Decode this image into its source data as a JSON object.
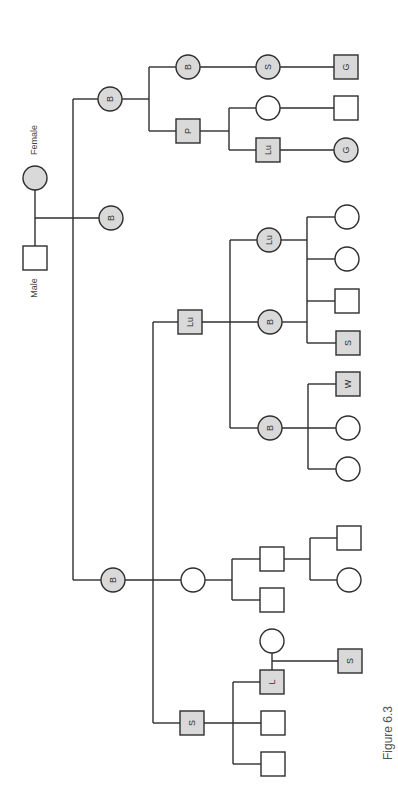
{
  "figure": {
    "caption": "Figure 6.3",
    "orientation": "rotated 90 degrees counter-clockwise",
    "colors": {
      "affected_fill": "#d9d9d9",
      "unaffected_fill": "#ffffff",
      "stroke": "#2e2e2e"
    }
  },
  "legend": {
    "female_label": "Female",
    "male_label": "Male"
  },
  "nodes": [
    {
      "id": "founder-female",
      "shape": "circle",
      "filled": true,
      "label": "",
      "x": 35,
      "y": 178
    },
    {
      "id": "founder-male",
      "shape": "square",
      "filled": false,
      "label": "",
      "x": 35,
      "y": 258
    },
    {
      "id": "g1-b-top",
      "shape": "circle",
      "filled": true,
      "label": "B",
      "x": 110,
      "y": 99
    },
    {
      "id": "g1-b-mid",
      "shape": "circle",
      "filled": true,
      "label": "B",
      "x": 111,
      "y": 218
    },
    {
      "id": "g1-b-low",
      "shape": "circle",
      "filled": true,
      "label": "B",
      "x": 113,
      "y": 580
    },
    {
      "id": "g2-b",
      "shape": "circle",
      "filled": true,
      "label": "B",
      "x": 188,
      "y": 67
    },
    {
      "id": "g2-p",
      "shape": "square",
      "filled": true,
      "label": "P",
      "x": 188,
      "y": 131
    },
    {
      "id": "g2-lu",
      "shape": "square",
      "filled": true,
      "label": "Lu",
      "x": 190,
      "y": 322
    },
    {
      "id": "g2-spouse-circle",
      "shape": "circle",
      "filled": false,
      "label": "",
      "x": 193,
      "y": 580
    },
    {
      "id": "g2-s",
      "shape": "square",
      "filled": true,
      "label": "S",
      "x": 192,
      "y": 723
    },
    {
      "id": "g3-s-circle",
      "shape": "circle",
      "filled": true,
      "label": "S",
      "x": 268,
      "y": 67
    },
    {
      "id": "g3-p-child-circle",
      "shape": "circle",
      "filled": false,
      "label": "",
      "x": 268,
      "y": 108
    },
    {
      "id": "g3-p-child-lu",
      "shape": "square",
      "filled": true,
      "label": "Lu",
      "x": 268,
      "y": 150
    },
    {
      "id": "g3-lu-circle",
      "shape": "circle",
      "filled": true,
      "label": "Lu",
      "x": 269,
      "y": 240
    },
    {
      "id": "g3-b-circle-a",
      "shape": "circle",
      "filled": true,
      "label": "B",
      "x": 270,
      "y": 322
    },
    {
      "id": "g3-b-circle-b",
      "shape": "circle",
      "filled": true,
      "label": "B",
      "x": 270,
      "y": 428
    },
    {
      "id": "g3-sq-a",
      "shape": "square",
      "filled": false,
      "label": "",
      "x": 272,
      "y": 559
    },
    {
      "id": "g3-sq-b",
      "shape": "square",
      "filled": false,
      "label": "",
      "x": 272,
      "y": 600
    },
    {
      "id": "g3-spouse-circle",
      "shape": "circle",
      "filled": false,
      "label": "",
      "x": 272,
      "y": 641
    },
    {
      "id": "g3-l",
      "shape": "square",
      "filled": true,
      "label": "L",
      "x": 272,
      "y": 682
    },
    {
      "id": "g3-sq-c",
      "shape": "square",
      "filled": false,
      "label": "",
      "x": 273,
      "y": 723
    },
    {
      "id": "g3-sq-d",
      "shape": "square",
      "filled": false,
      "label": "",
      "x": 273,
      "y": 764
    },
    {
      "id": "g4-g-square",
      "shape": "square",
      "filled": true,
      "label": "G",
      "x": 346,
      "y": 67
    },
    {
      "id": "g4-square",
      "shape": "square",
      "filled": false,
      "label": "",
      "x": 346,
      "y": 108
    },
    {
      "id": "g4-g-circle",
      "shape": "circle",
      "filled": true,
      "label": "G",
      "x": 346,
      "y": 150
    },
    {
      "id": "g4-circle-a",
      "shape": "circle",
      "filled": false,
      "label": "",
      "x": 347,
      "y": 217
    },
    {
      "id": "g4-circle-b",
      "shape": "circle",
      "filled": false,
      "label": "",
      "x": 347,
      "y": 259
    },
    {
      "id": "g4-square-c",
      "shape": "square",
      "filled": false,
      "label": "",
      "x": 347,
      "y": 301
    },
    {
      "id": "g4-s-square",
      "shape": "square",
      "filled": true,
      "label": "S",
      "x": 348,
      "y": 343
    },
    {
      "id": "g4-w-square",
      "shape": "square",
      "filled": true,
      "label": "W",
      "x": 348,
      "y": 384
    },
    {
      "id": "g4-circle-d",
      "shape": "circle",
      "filled": false,
      "label": "",
      "x": 348,
      "y": 428
    },
    {
      "id": "g4-circle-e",
      "shape": "circle",
      "filled": false,
      "label": "",
      "x": 348,
      "y": 469
    },
    {
      "id": "g4-square-f",
      "shape": "square",
      "filled": false,
      "label": "",
      "x": 349,
      "y": 538
    },
    {
      "id": "g4-circle-g",
      "shape": "circle",
      "filled": false,
      "label": "",
      "x": 349,
      "y": 580
    },
    {
      "id": "g4-s-square-b",
      "shape": "square",
      "filled": true,
      "label": "S",
      "x": 350,
      "y": 661
    }
  ],
  "edges": [
    [
      35,
      190,
      35,
      246
    ],
    [
      35,
      218,
      99,
      218
    ],
    [
      73,
      99,
      98,
      99
    ],
    [
      73,
      99,
      73,
      580
    ],
    [
      73,
      580,
      101,
      580
    ],
    [
      122,
      99,
      149,
      99
    ],
    [
      149,
      67,
      149,
      131
    ],
    [
      149,
      67,
      176,
      67
    ],
    [
      149,
      131,
      176,
      131
    ],
    [
      200,
      67,
      256,
      67
    ],
    [
      280,
      67,
      334,
      67
    ],
    [
      200,
      131,
      229,
      131
    ],
    [
      229,
      108,
      229,
      150
    ],
    [
      229,
      108,
      256,
      108
    ],
    [
      229,
      150,
      256,
      150
    ],
    [
      280,
      108,
      334,
      108
    ],
    [
      280,
      150,
      334,
      150
    ],
    [
      153,
      322,
      178,
      322
    ],
    [
      153,
      322,
      153,
      723
    ],
    [
      153,
      723,
      180,
      723
    ],
    [
      202,
      322,
      258,
      322
    ],
    [
      230,
      240,
      230,
      428
    ],
    [
      230,
      240,
      257,
      240
    ],
    [
      230,
      428,
      258,
      428
    ],
    [
      281,
      240,
      307,
      240
    ],
    [
      282,
      322,
      307,
      322
    ],
    [
      307,
      217,
      307,
      343
    ],
    [
      307,
      217,
      335,
      217
    ],
    [
      307,
      259,
      335,
      259
    ],
    [
      307,
      301,
      335,
      301
    ],
    [
      307,
      343,
      336,
      343
    ],
    [
      282,
      428,
      336,
      428
    ],
    [
      308,
      384,
      308,
      469
    ],
    [
      308,
      384,
      336,
      384
    ],
    [
      308,
      469,
      336,
      469
    ],
    [
      125,
      580,
      181,
      580
    ],
    [
      205,
      580,
      232,
      580
    ],
    [
      232,
      559,
      232,
      600
    ],
    [
      232,
      559,
      260,
      559
    ],
    [
      232,
      600,
      260,
      600
    ],
    [
      284,
      559,
      310,
      559
    ],
    [
      310,
      538,
      310,
      580
    ],
    [
      310,
      538,
      337,
      538
    ],
    [
      310,
      580,
      337,
      580
    ],
    [
      204,
      723,
      261,
      723
    ],
    [
      233,
      682,
      233,
      764
    ],
    [
      233,
      682,
      260,
      682
    ],
    [
      233,
      764,
      261,
      764
    ],
    [
      272,
      653,
      272,
      670
    ],
    [
      272,
      661,
      338,
      661
    ]
  ],
  "labels": [
    {
      "id": "female-label",
      "text": "Female",
      "x": 37,
      "y": 140
    },
    {
      "id": "male-label",
      "text": "Male",
      "x": 37,
      "y": 288
    }
  ],
  "caption_position": {
    "x": 392,
    "y": 733
  }
}
